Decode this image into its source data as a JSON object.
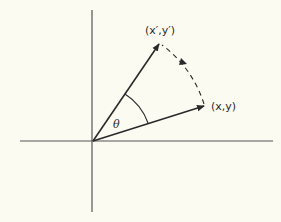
{
  "diagram": {
    "colors": {
      "background": "#fcfbf2",
      "ink": "#2a2a2a",
      "axis": "#555555"
    },
    "axes": {
      "horizontal": {
        "x1": 20,
        "y1": 141,
        "x2": 273,
        "y2": 141
      },
      "vertical": {
        "x1": 92,
        "y1": 10,
        "x2": 92,
        "y2": 212
      }
    },
    "origin": {
      "x": 93,
      "y": 141
    },
    "vectors": [
      {
        "id": "original",
        "label": "(x,y)",
        "tip": {
          "x": 205,
          "y": 106
        },
        "label_pos": {
          "x": 211,
          "y": 110
        }
      },
      {
        "id": "rotated",
        "label": "(x′,y′)",
        "tip": {
          "x": 160,
          "y": 43
        },
        "label_pos": {
          "x": 160,
          "y": 34
        }
      }
    ],
    "angle": {
      "symbol": "θ",
      "label_pos": {
        "x": 113,
        "y": 128
      }
    },
    "rotation_arc": {
      "style": "dashed",
      "direction": "counterclockwise"
    }
  }
}
